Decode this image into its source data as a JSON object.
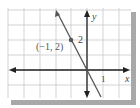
{
  "figure": {
    "type": "coordinate-graph",
    "axes": {
      "x_label": "x",
      "y_label": "y",
      "x_tick_label": "1",
      "y_tick_label": "2"
    },
    "point": {
      "label": "(−1, 2)",
      "x": -1,
      "y": 2
    },
    "line": {
      "description": "line through origin and (-1, 2)",
      "slope": -2,
      "intercept": 0
    },
    "colors": {
      "grid": "#c8c8c8",
      "axis": "#222222",
      "line": "#555555",
      "point": "#555555",
      "shadow": "#a0a0a0",
      "background": "#ffffff"
    }
  }
}
